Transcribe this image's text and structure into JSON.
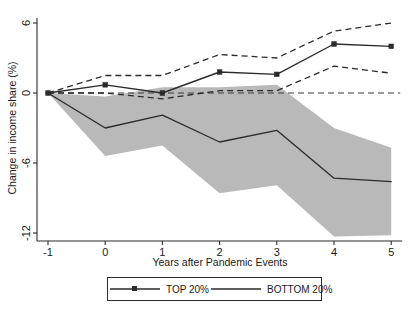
{
  "chart_data": {
    "type": "line",
    "title": "",
    "xlabel": "Years after Pandemic Events",
    "ylabel": "Change in income share (%)",
    "x": [
      -1,
      0,
      1,
      2,
      3,
      4,
      5
    ],
    "xlim": [
      -1.35,
      5.35
    ],
    "ylim": [
      -13.2,
      7.4
    ],
    "xticks": [
      -1,
      0,
      1,
      2,
      3,
      4,
      5
    ],
    "xticklabels": [
      "-1",
      "0",
      "1",
      "2",
      "3",
      "4",
      "5"
    ],
    "yticks": [
      6,
      0,
      -6,
      -12
    ],
    "yticklabels": [
      "6",
      "0",
      "-6",
      "-12"
    ],
    "grid": false,
    "zero_reference_line": 0,
    "series": [
      {
        "name": "TOP 20%",
        "style": "solid-with-markers",
        "color": "#2b2b2b",
        "values": [
          0,
          0.7,
          0.0,
          1.8,
          1.6,
          4.2,
          4.0
        ],
        "ci_upper": [
          0,
          1.5,
          1.5,
          3.3,
          3.0,
          5.3,
          6.0
        ],
        "ci_lower": [
          0,
          0.0,
          -0.5,
          0.2,
          0.2,
          2.3,
          1.7
        ],
        "ci_style": "dashed-lines"
      },
      {
        "name": "BOTTOM 20%",
        "style": "solid",
        "color": "#2b2b2b",
        "values": [
          0,
          -3.0,
          -1.9,
          -4.2,
          -3.2,
          -7.3,
          -7.6
        ],
        "ci_upper": [
          0,
          -0.3,
          0.5,
          0.5,
          0.7,
          -3.0,
          -4.7
        ],
        "ci_lower": [
          0,
          -5.4,
          -4.5,
          -8.6,
          -7.9,
          -12.3,
          -12.2
        ],
        "ci_style": "shaded-band",
        "ci_band_color": "#b9b9b9"
      }
    ]
  },
  "axes": {
    "y_title": "Change in income share (%)",
    "x_title": "Years after Pandemic Events",
    "y_tick_labels": [
      "6",
      "0",
      "-6",
      "-12"
    ],
    "x_tick_labels": [
      "-1",
      "0",
      "1",
      "2",
      "3",
      "4",
      "5"
    ]
  },
  "legend": {
    "entries": [
      {
        "label": "TOP 20%",
        "marker": "square",
        "line": "solid"
      },
      {
        "label": "BOTTOM 20%",
        "marker": "none",
        "line": "solid"
      }
    ]
  }
}
